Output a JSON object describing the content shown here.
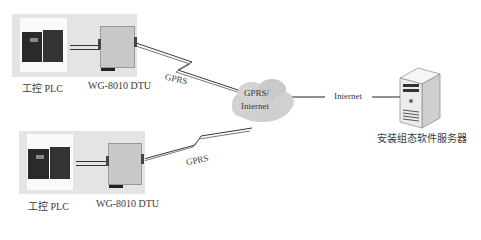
{
  "nodes": {
    "site1": {
      "plc_label": "工控 PLC",
      "dtu_label": "WG-8010 DTU",
      "link_label": "GPRS"
    },
    "site2": {
      "plc_label": "工控 PLC",
      "dtu_label": "WG-8010 DTU",
      "link_label": "GPRS"
    },
    "cloud": {
      "line1": "GPRS/",
      "line2": "Internet"
    },
    "internet_link": {
      "label": "Internet"
    },
    "server": {
      "label": "安装组态软件服务器"
    }
  },
  "colors": {
    "panel_bg": "#e4e4e4",
    "cloud": "#cfcfcf",
    "line": "#3a3a3a",
    "device_dark": "#2a2a2a",
    "server_body": "#efefef"
  }
}
